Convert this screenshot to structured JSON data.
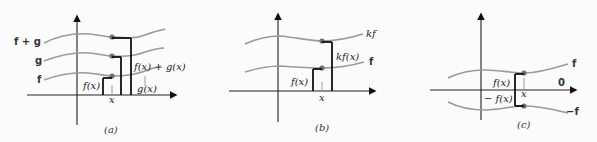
{
  "panels": [
    {
      "id": "a",
      "caption": "(a)",
      "curve_labels": {
        "f_plus_g": "f + g",
        "g": "g",
        "f": "f"
      },
      "annotations": {
        "fx": "f(x)",
        "x": "x",
        "gx": "g(x)",
        "fx_plus_gx": "f(x) + g(x)"
      }
    },
    {
      "id": "b",
      "caption": "(b)",
      "curve_labels": {
        "kf": "kf",
        "f": "f"
      },
      "annotations": {
        "fx": "f(x)",
        "x": "x",
        "kfx": "kf(x)"
      }
    },
    {
      "id": "c",
      "caption": "(c)",
      "curve_labels": {
        "f": "f",
        "neg_f": "−f",
        "zero": "0"
      },
      "annotations": {
        "fx": "f(x)",
        "neg_fx": "− f(x)",
        "x": "x"
      }
    }
  ],
  "colors": {
    "curve": "#9a9a9a",
    "axis": "#222222",
    "dot": "#6e6e6e",
    "background": "#fbfbfb"
  }
}
